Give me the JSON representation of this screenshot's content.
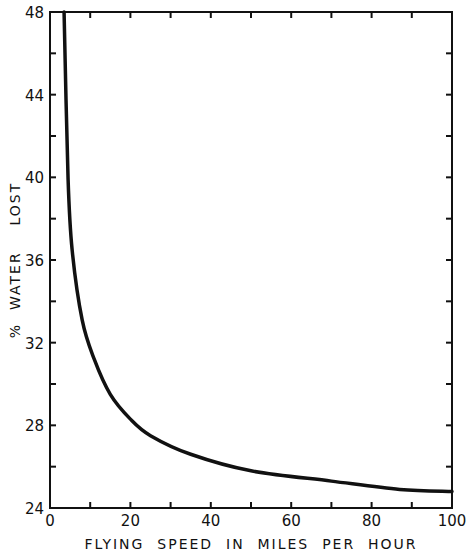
{
  "chart_data": {
    "type": "line",
    "title": "",
    "xlabel": "FLYING  SPEED  IN  MILES  PER  HOUR",
    "ylabel": "%  WATER    LOST",
    "xlim": [
      0,
      100
    ],
    "ylim": [
      24,
      48
    ],
    "x_ticks": [
      0,
      20,
      40,
      60,
      80,
      100
    ],
    "x_minor_ticks": [
      10,
      30,
      50,
      70,
      90
    ],
    "y_ticks": [
      24,
      28,
      32,
      36,
      40,
      44,
      48
    ],
    "y_minor_ticks": [
      26,
      30,
      34,
      38,
      42,
      46
    ],
    "grid": false,
    "legend": null,
    "series": [
      {
        "name": "% water lost",
        "color": "#111111",
        "x": [
          3.5,
          4.5,
          5.5,
          8,
          11,
          15,
          20,
          25,
          35,
          50,
          70,
          87,
          100
        ],
        "y": [
          48,
          39.9,
          36.5,
          33.1,
          31.2,
          29.5,
          28.3,
          27.5,
          26.6,
          25.8,
          25.3,
          24.9,
          24.8
        ]
      }
    ]
  }
}
